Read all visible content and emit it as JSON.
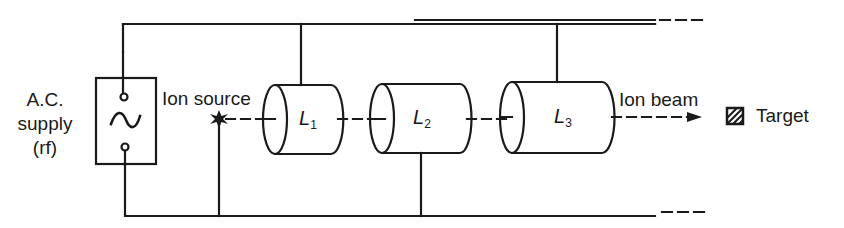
{
  "diagram": {
    "type": "linear-accelerator-schematic",
    "colors": {
      "stroke": "#1a1a1a",
      "background": "#ffffff"
    },
    "supply": {
      "label_lines": [
        "A.C.",
        "supply",
        "(rf)"
      ],
      "symbol": "~"
    },
    "ion_source": {
      "label": "Ion source"
    },
    "lenses": [
      {
        "letter": "L",
        "index": "1"
      },
      {
        "letter": "L",
        "index": "2"
      },
      {
        "letter": "L",
        "index": "3"
      }
    ],
    "ion_beam": {
      "label": "Ion beam"
    },
    "target": {
      "label": "Target"
    }
  }
}
